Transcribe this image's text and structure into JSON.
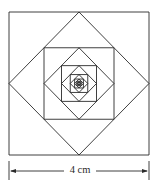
{
  "diagram": {
    "outer_square": {
      "x": 9,
      "y": 12,
      "width": 140,
      "height": 143
    },
    "levels": 14,
    "stroke_color": "#2a2a2a",
    "background": "#ffffff"
  },
  "dimension": {
    "label": "4 cm",
    "left_x": 9,
    "right_x": 149,
    "y": 171,
    "tick_top": 161,
    "tick_bottom": 180
  }
}
